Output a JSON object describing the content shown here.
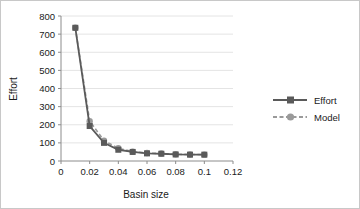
{
  "chart_data": {
    "type": "line",
    "title": "",
    "xlabel": "Basin size",
    "ylabel": "Effort",
    "xlim": [
      0,
      0.12
    ],
    "ylim": [
      0,
      800
    ],
    "xticks": [
      "0",
      "0.02",
      "0.04",
      "0.06",
      "0.08",
      "0.1",
      "0.12"
    ],
    "xtick_values": [
      0,
      0.02,
      0.04,
      0.06,
      0.08,
      0.1,
      0.12
    ],
    "yticks": [
      "0",
      "100",
      "200",
      "300",
      "400",
      "500",
      "600",
      "700",
      "800"
    ],
    "ytick_values": [
      0,
      100,
      200,
      300,
      400,
      500,
      600,
      700,
      800
    ],
    "grid": "horizontal",
    "legend_position": "right",
    "x": [
      0.01,
      0.02,
      0.03,
      0.04,
      0.05,
      0.06,
      0.07,
      0.08,
      0.09,
      0.1
    ],
    "series": [
      {
        "name": "Effort",
        "marker": "square",
        "linestyle": "solid",
        "color": "#5a5a5a",
        "values": [
          735,
          193,
          100,
          62,
          50,
          42,
          40,
          36,
          35,
          35
        ]
      },
      {
        "name": "Model",
        "marker": "circle",
        "linestyle": "dashed",
        "color": "#9a9a9a",
        "values": [
          735,
          220,
          112,
          70,
          52,
          44,
          41,
          37,
          36,
          35
        ]
      }
    ]
  },
  "legend": {
    "items": [
      {
        "label": "Effort"
      },
      {
        "label": "Model"
      }
    ]
  },
  "colors": {
    "effort": "#5a5a5a",
    "model": "#9a9a9a",
    "gridline": "#e4e4e4",
    "axis": "#8c8c8c",
    "text": "#1a1a1a",
    "background": "#ffffff"
  }
}
